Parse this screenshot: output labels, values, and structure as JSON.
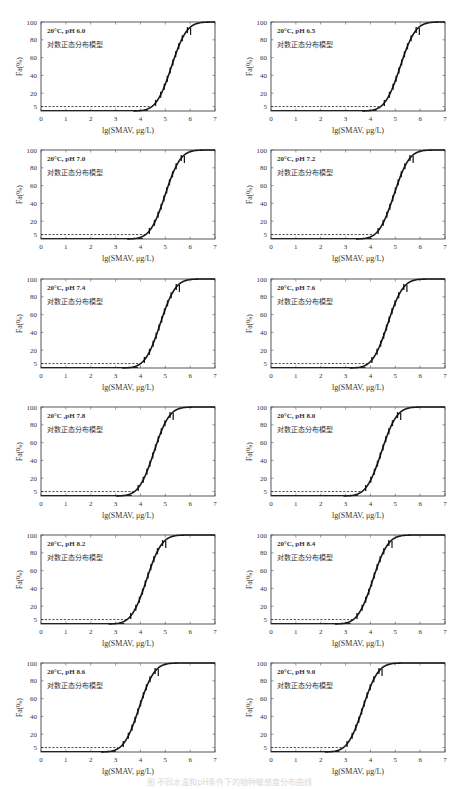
{
  "figure": {
    "caption": "图 不同水温和pH条件下的物种敏感度分布曲线"
  },
  "chart_data": [
    {
      "type": "line",
      "panel": 1,
      "title": "20°C, pH 6.0",
      "subtitle": "对数正态分布模型",
      "xlabel": "lg(SMAV, μg/L)",
      "ylabel": "Fa(%)",
      "xlim": [
        0,
        7
      ],
      "ylim": [
        0,
        100
      ],
      "xticks": [
        0,
        1,
        2,
        3,
        4,
        5,
        6,
        7
      ],
      "yticks": [
        5,
        20,
        40,
        60,
        80,
        100
      ],
      "grid": false,
      "mu": 5.25,
      "sigma": 0.48,
      "hc5_x": 4.4,
      "hc5_y": 5
    },
    {
      "type": "line",
      "panel": 2,
      "title": "20°C, pH 6.5",
      "subtitle": "对数正态分布模型",
      "xlabel": "lg(SMAV, μg/L)",
      "ylabel": "Fa(%)",
      "xlim": [
        0,
        7
      ],
      "ylim": [
        0,
        100
      ],
      "xticks": [
        0,
        1,
        2,
        3,
        4,
        5,
        6,
        7
      ],
      "yticks": [
        5,
        20,
        40,
        60,
        80,
        100
      ],
      "grid": false,
      "mu": 5.2,
      "sigma": 0.48,
      "hc5_x": 4.35,
      "hc5_y": 5
    },
    {
      "type": "line",
      "panel": 3,
      "title": "20°C, pH 7.0",
      "subtitle": "对数正态分布模型",
      "xlabel": "lg(SMAV, μg/L)",
      "ylabel": "Fa(%)",
      "xlim": [
        0,
        7
      ],
      "ylim": [
        0,
        100
      ],
      "xticks": [
        0,
        1,
        2,
        3,
        4,
        5,
        6,
        7
      ],
      "yticks": [
        5,
        20,
        40,
        60,
        80,
        100
      ],
      "grid": false,
      "mu": 5.0,
      "sigma": 0.48,
      "hc5_x": 4.2,
      "hc5_y": 5
    },
    {
      "type": "line",
      "panel": 4,
      "title": "20°C, pH 7.2",
      "subtitle": "对数正态分布模型",
      "xlabel": "lg(SMAV, μg/L)",
      "ylabel": "Fa(%)",
      "xlim": [
        0,
        7
      ],
      "ylim": [
        0,
        100
      ],
      "xticks": [
        0,
        1,
        2,
        3,
        4,
        5,
        6,
        7
      ],
      "yticks": [
        5,
        20,
        40,
        60,
        80,
        100
      ],
      "grid": false,
      "mu": 4.95,
      "sigma": 0.48,
      "hc5_x": 4.15,
      "hc5_y": 5
    },
    {
      "type": "line",
      "panel": 5,
      "title": "20°C, pH 7.4",
      "subtitle": "对数正态分布模型",
      "xlabel": "lg(SMAV, μg/L)",
      "ylabel": "Fa(%)",
      "xlim": [
        0,
        7
      ],
      "ylim": [
        0,
        100
      ],
      "xticks": [
        0,
        1,
        2,
        3,
        4,
        5,
        6,
        7
      ],
      "yticks": [
        5,
        20,
        40,
        60,
        80,
        100
      ],
      "grid": false,
      "mu": 4.8,
      "sigma": 0.48,
      "hc5_x": 4.0,
      "hc5_y": 5
    },
    {
      "type": "line",
      "panel": 6,
      "title": "20°C, pH 7.6",
      "subtitle": "对数正态分布模型",
      "xlabel": "lg(SMAV, μg/L)",
      "ylabel": "Fa(%)",
      "xlim": [
        0,
        7
      ],
      "ylim": [
        0,
        100
      ],
      "xticks": [
        0,
        1,
        2,
        3,
        4,
        5,
        6,
        7
      ],
      "yticks": [
        5,
        20,
        40,
        60,
        80,
        100
      ],
      "grid": false,
      "mu": 4.7,
      "sigma": 0.48,
      "hc5_x": 3.9,
      "hc5_y": 5
    },
    {
      "type": "line",
      "panel": 7,
      "title": "20°C ,pH 7.8",
      "subtitle": "对数正态分布模型",
      "xlabel": "lg(SMAV, μg/L)",
      "ylabel": "Fa(%)",
      "xlim": [
        0,
        7
      ],
      "ylim": [
        0,
        100
      ],
      "xticks": [
        0,
        1,
        2,
        3,
        4,
        5,
        6,
        7
      ],
      "yticks": [
        5,
        20,
        40,
        60,
        80,
        100
      ],
      "grid": false,
      "mu": 4.55,
      "sigma": 0.48,
      "hc5_x": 3.75,
      "hc5_y": 5
    },
    {
      "type": "line",
      "panel": 8,
      "title": "20°C, pH 8.0",
      "subtitle": "对数正态分布模型",
      "xlabel": "lg(SMAV, μg/L)",
      "ylabel": "Fa(%)",
      "xlim": [
        0,
        7
      ],
      "ylim": [
        0,
        100
      ],
      "xticks": [
        0,
        1,
        2,
        3,
        4,
        5,
        6,
        7
      ],
      "yticks": [
        5,
        20,
        40,
        60,
        80,
        100
      ],
      "grid": false,
      "mu": 4.45,
      "sigma": 0.48,
      "hc5_x": 3.6,
      "hc5_y": 5
    },
    {
      "type": "line",
      "panel": 9,
      "title": "20°C, pH 8.2",
      "subtitle": "对数正态分布模型",
      "xlabel": "lg(SMAV, μg/L)",
      "ylabel": "Fa(%)",
      "xlim": [
        0,
        7
      ],
      "ylim": [
        0,
        100
      ],
      "xticks": [
        0,
        1,
        2,
        3,
        4,
        5,
        6,
        7
      ],
      "yticks": [
        5,
        20,
        40,
        60,
        80,
        100
      ],
      "grid": false,
      "mu": 4.25,
      "sigma": 0.48,
      "hc5_x": 3.45,
      "hc5_y": 5
    },
    {
      "type": "line",
      "panel": 10,
      "title": "20°C, pH 8.4",
      "subtitle": "对数正态分布模型",
      "xlabel": "lg(SMAV, μg/L)",
      "ylabel": "Fa(%)",
      "xlim": [
        0,
        7
      ],
      "ylim": [
        0,
        100
      ],
      "xticks": [
        0,
        1,
        2,
        3,
        4,
        5,
        6,
        7
      ],
      "yticks": [
        5,
        20,
        40,
        60,
        80,
        100
      ],
      "grid": false,
      "mu": 4.1,
      "sigma": 0.48,
      "hc5_x": 3.3,
      "hc5_y": 5
    },
    {
      "type": "line",
      "panel": 11,
      "title": "20°C, pH 8.6",
      "subtitle": "对数正态分布模型",
      "xlabel": "lg(SMAV, μg/L)",
      "ylabel": "Fa(%)",
      "xlim": [
        0,
        7
      ],
      "ylim": [
        0,
        100
      ],
      "xticks": [
        0,
        1,
        2,
        3,
        4,
        5,
        6,
        7
      ],
      "yticks": [
        5,
        20,
        40,
        60,
        80,
        100
      ],
      "grid": false,
      "mu": 3.95,
      "sigma": 0.48,
      "hc5_x": 3.1,
      "hc5_y": 5
    },
    {
      "type": "line",
      "panel": 12,
      "title": "20°C, pH 9.0",
      "subtitle": "对数正态分布模型",
      "xlabel": "lg(SMAV, μg/L)",
      "ylabel": "Fa(%)",
      "xlim": [
        0,
        7
      ],
      "ylim": [
        0,
        100
      ],
      "xticks": [
        0,
        1,
        2,
        3,
        4,
        5,
        6,
        7
      ],
      "yticks": [
        5,
        20,
        40,
        60,
        80,
        100
      ],
      "grid": false,
      "mu": 3.7,
      "sigma": 0.48,
      "hc5_x": 2.85,
      "hc5_y": 5
    }
  ]
}
